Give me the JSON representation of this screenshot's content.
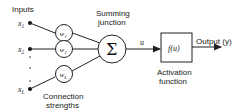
{
  "diagram": {
    "inputs_label": "Inputs",
    "inputs": [
      {
        "symbol": "x",
        "sub": "1",
        "weight": "w",
        "weight_sub": "1"
      },
      {
        "symbol": "x",
        "sub": "2",
        "weight": "w",
        "weight_sub": "2"
      },
      {
        "symbol": "x",
        "sub": "L",
        "weight": "w",
        "weight_sub": "L"
      }
    ],
    "ellipsis": "⋮",
    "connection_label_line1": "Connection",
    "connection_label_line2": "strengths",
    "summing_label_line1": "Summing",
    "summing_label_line2": "junction",
    "summing_symbol": "Σ",
    "signal_label": "u",
    "activation_box_text": "f(u)",
    "activation_label_line1": "Activation",
    "activation_label_line2": "function",
    "output_label": "Output (y)",
    "colors": {
      "stroke": "#222222",
      "background": "#ffffff"
    }
  }
}
